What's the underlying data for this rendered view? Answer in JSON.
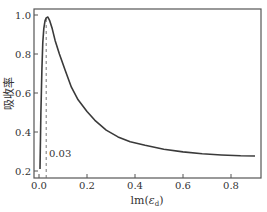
{
  "chart_data": {
    "type": "line",
    "title": "",
    "xlabel": "lm(ε_d)",
    "xlabel_main": "lm(",
    "xlabel_symbol": "ε",
    "xlabel_sub": "d",
    "xlabel_close": ")",
    "ylabel": "吸收率",
    "xlim": [
      -0.02,
      0.92
    ],
    "ylim": [
      0.18,
      1.03
    ],
    "xticks": [
      0.0,
      0.2,
      0.4,
      0.6,
      0.8
    ],
    "xtick_labels": [
      "0.0",
      "0.2",
      "0.4",
      "0.6",
      "0.8"
    ],
    "yticks": [
      0.2,
      0.4,
      0.6,
      0.8,
      1.0
    ],
    "ytick_labels": [
      "0.2",
      "0.4",
      "0.6",
      "0.8",
      "1.0"
    ],
    "grid": false,
    "legend": null,
    "series": [
      {
        "name": "吸收率",
        "color": "#3a3a3a",
        "x": [
          0.004,
          0.008,
          0.012,
          0.016,
          0.02,
          0.025,
          0.03,
          0.037,
          0.045,
          0.055,
          0.067,
          0.085,
          0.108,
          0.135,
          0.163,
          0.2,
          0.233,
          0.28,
          0.329,
          0.38,
          0.442,
          0.52,
          0.6,
          0.68,
          0.76,
          0.84,
          0.9
        ],
        "y": [
          0.21,
          0.5,
          0.72,
          0.86,
          0.93,
          0.97,
          0.985,
          0.99,
          0.97,
          0.93,
          0.87,
          0.8,
          0.72,
          0.63,
          0.565,
          0.505,
          0.46,
          0.41,
          0.375,
          0.35,
          0.332,
          0.312,
          0.298,
          0.288,
          0.282,
          0.278,
          0.277
        ]
      }
    ],
    "annotations": [
      {
        "type": "vline",
        "x": 0.03,
        "style": "dashed",
        "from_y": 0.18,
        "to_y": 0.99,
        "label": "0.03",
        "label_x": 0.05,
        "label_y": 0.26
      }
    ]
  }
}
